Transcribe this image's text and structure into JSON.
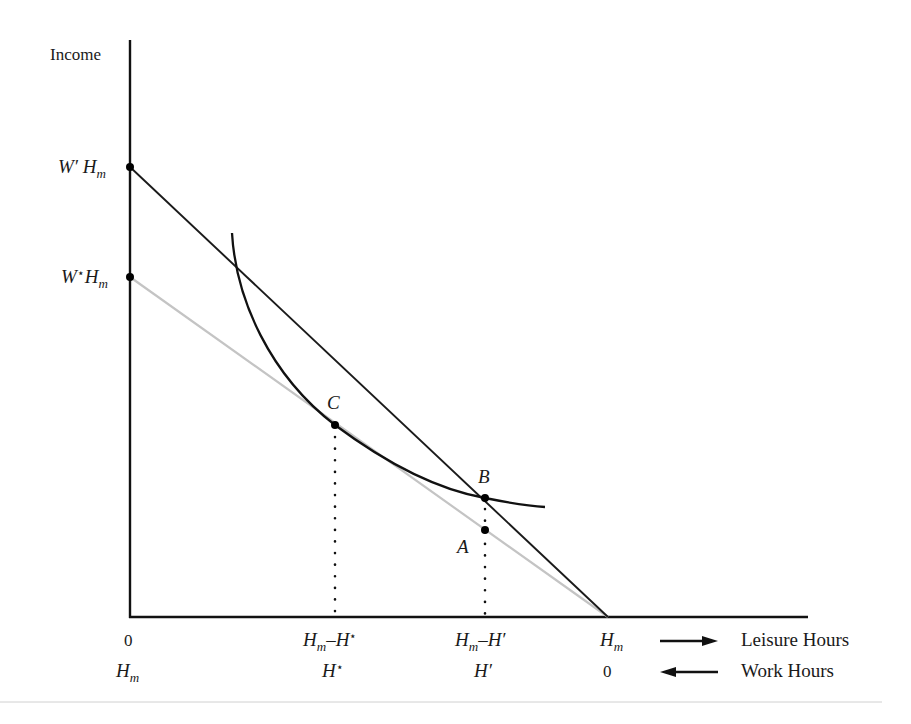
{
  "diagram": {
    "y_axis_label": "Income",
    "y_ticks": [
      {
        "id": "w_prime_hm",
        "base": "W′ H",
        "sub": "m",
        "y": 167
      },
      {
        "id": "w_star_hm",
        "base": "W",
        "star": "⋆",
        "base2": "H",
        "sub": "m",
        "y": 277
      }
    ],
    "x_labels_leisure": {
      "origin": "0",
      "h_star": {
        "base": "H",
        "sub": "m",
        "rest": "–H",
        "star": "⋆"
      },
      "h_prime": {
        "base": "H",
        "sub": "m",
        "rest": "–H′"
      },
      "end": {
        "base": "H",
        "sub": "m"
      },
      "axis_name": "Leisure Hours"
    },
    "x_labels_work": {
      "origin": {
        "base": "H",
        "sub": "m"
      },
      "h_star": {
        "base": "H",
        "star": "⋆"
      },
      "h_prime": "H′",
      "end": "0",
      "axis_name": "Work Hours"
    },
    "points": [
      {
        "id": "A",
        "label": "A",
        "x": 485,
        "y": 530
      },
      {
        "id": "B",
        "label": "B",
        "x": 485,
        "y": 498
      },
      {
        "id": "C",
        "label": "C",
        "x": 335,
        "y": 425
      }
    ],
    "lines": {
      "new_budget": {
        "from": [
          130,
          167
        ],
        "to": [
          608,
          617
        ],
        "color": "#1a1a1a"
      },
      "old_budget": {
        "from": [
          130,
          277
        ],
        "to": [
          608,
          617
        ],
        "color": "#c4c4c4"
      },
      "indifference_curve": {
        "start": [
          232,
          233
        ],
        "end": [
          545,
          507
        ]
      }
    },
    "arrows": {
      "leisure": "right",
      "work": "left"
    }
  }
}
